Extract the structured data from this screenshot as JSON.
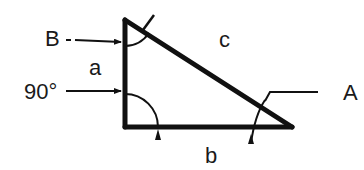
{
  "diagram": {
    "type": "right-triangle",
    "labels": {
      "vertex_top": "B",
      "vertex_right": "A",
      "right_angle": "90°",
      "side_vertical": "a",
      "side_horizontal": "b",
      "side_hypotenuse": "c"
    },
    "colors": {
      "stroke": "#111111",
      "background": "#ffffff"
    }
  }
}
